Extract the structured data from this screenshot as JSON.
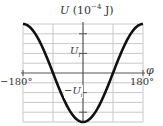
{
  "chart_data": {
    "type": "line",
    "title_parts": {
      "var": "U",
      "unit": "(10",
      "exp": "−4",
      "unit_end": " J)"
    },
    "xlabel": "φ",
    "ylabel": "U (10^-4 J)",
    "xlim": [
      -180,
      180
    ],
    "ylim": [
      -2.5,
      2.5
    ],
    "x_tick_labels": [
      "−180°",
      "180°"
    ],
    "y_tick_labels": [
      "U_i",
      "−U_i"
    ],
    "y_tick_label_display": {
      "pos": "U",
      "pos_sub": "i",
      "neg": "−U",
      "neg_sub": "i"
    },
    "grid": true,
    "series": [
      {
        "name": "U(φ)",
        "color": "#111111",
        "x": [
          -180,
          -135,
          -90,
          -45,
          0,
          45,
          90,
          135,
          180
        ],
        "y": [
          2.5,
          1.77,
          0,
          -1.77,
          -2.5,
          -1.77,
          0,
          1.77,
          2.5
        ]
      }
    ]
  },
  "colors": {
    "grid": "#c8c8c8",
    "axis": "#555555",
    "curve": "#111111",
    "background": "#ffffff"
  }
}
